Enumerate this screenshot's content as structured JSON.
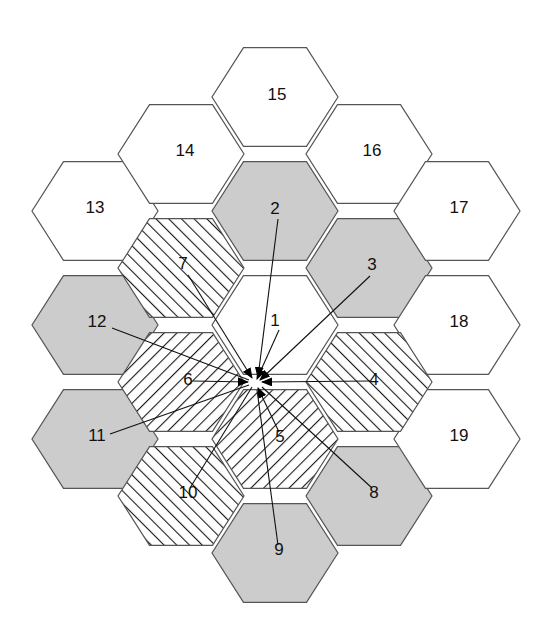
{
  "figure": {
    "type": "hex-grid-diagram",
    "width": 558,
    "height": 640,
    "background": "#ffffff",
    "colors": {
      "white_fill": "#ffffff",
      "gray_fill": "#cccccc",
      "hatch_stroke": "#1a1a1a",
      "outline": "#555555",
      "label_text": "#111111",
      "leader_line": "#111111"
    },
    "hex_geometry": {
      "circumradius": 63,
      "orientation": "flat-top-rotated (vertices left and right)",
      "column_step_x": 94.5,
      "row_step_y": 114,
      "half_row_step_y": 57
    },
    "fill_legend": {
      "white": "plain white fill",
      "gray": "solid light gray fill",
      "hatch-forward": "diagonal hatch lines running lower-left to upper-right ( / )",
      "hatch-back": "diagonal hatch lines running upper-left to lower-right ( \\ )"
    }
  },
  "convergence_point": {
    "x": 255,
    "y": 382
  },
  "cells": [
    {
      "id": "hex-1",
      "label": "1",
      "cx": 275,
      "cy": 325,
      "fill": "white",
      "label_x": 275,
      "label_y": 322,
      "ring": 0
    },
    {
      "id": "hex-2",
      "label": "2",
      "cx": 275,
      "cy": 211,
      "fill": "gray",
      "label_x": 275,
      "label_y": 210,
      "ring": 1
    },
    {
      "id": "hex-3",
      "label": "3",
      "cx": 369,
      "cy": 268,
      "fill": "gray",
      "label_x": 372,
      "label_y": 266,
      "ring": 1
    },
    {
      "id": "hex-4",
      "label": "4",
      "cx": 369,
      "cy": 382,
      "fill": "hatch-forward",
      "label_x": 374,
      "label_y": 381,
      "ring": 1
    },
    {
      "id": "hex-5",
      "label": "5",
      "cx": 275,
      "cy": 439,
      "fill": "hatch-back",
      "label_x": 280,
      "label_y": 438,
      "ring": 1
    },
    {
      "id": "hex-6",
      "label": "6",
      "cx": 181,
      "cy": 382,
      "fill": "hatch-back",
      "label_x": 188,
      "label_y": 381,
      "ring": 1
    },
    {
      "id": "hex-7",
      "label": "7",
      "cx": 181,
      "cy": 268,
      "fill": "hatch-forward",
      "label_x": 183,
      "label_y": 265,
      "ring": 1
    },
    {
      "id": "hex-8",
      "label": "8",
      "cx": 369,
      "cy": 496,
      "fill": "gray",
      "label_x": 374,
      "label_y": 494,
      "ring": 2
    },
    {
      "id": "hex-9",
      "label": "9",
      "cx": 275,
      "cy": 553,
      "fill": "gray",
      "label_x": 279,
      "label_y": 551,
      "ring": 2
    },
    {
      "id": "hex-10",
      "label": "10",
      "cx": 181,
      "cy": 496,
      "fill": "hatch-forward",
      "label_x": 188,
      "label_y": 494,
      "ring": 2
    },
    {
      "id": "hex-11",
      "label": "11",
      "cx": 95,
      "cy": 439,
      "fill": "gray",
      "label_x": 97,
      "label_y": 437,
      "ring": 2
    },
    {
      "id": "hex-12",
      "label": "12",
      "cx": 95,
      "cy": 325,
      "fill": "gray",
      "label_x": 97,
      "label_y": 323,
      "ring": 2
    },
    {
      "id": "hex-13",
      "label": "13",
      "cx": 95,
      "cy": 211,
      "fill": "white",
      "label_x": 95,
      "label_y": 209,
      "ring": 2
    },
    {
      "id": "hex-14",
      "label": "14",
      "cx": 181,
      "cy": 154,
      "fill": "white",
      "label_x": 185,
      "label_y": 152,
      "ring": 2
    },
    {
      "id": "hex-15",
      "label": "15",
      "cx": 275,
      "cy": 97,
      "fill": "white",
      "label_x": 277,
      "label_y": 96,
      "ring": 2
    },
    {
      "id": "hex-16",
      "label": "16",
      "cx": 369,
      "cy": 154,
      "fill": "white",
      "label_x": 372,
      "label_y": 152,
      "ring": 2
    },
    {
      "id": "hex-17",
      "label": "17",
      "cx": 457,
      "cy": 211,
      "fill": "white",
      "label_x": 459,
      "label_y": 209,
      "ring": 2
    },
    {
      "id": "hex-18",
      "label": "18",
      "cx": 457,
      "cy": 325,
      "fill": "white",
      "label_x": 459,
      "label_y": 323,
      "ring": 2
    },
    {
      "id": "hex-19",
      "label": "19",
      "cx": 457,
      "cy": 439,
      "fill": "white",
      "label_x": 459,
      "label_y": 437,
      "ring": 2
    }
  ],
  "leaders": [
    {
      "for": "1",
      "from_x": 279,
      "from_y": 330,
      "to_x": 257,
      "to_y": 379,
      "arrow": true
    },
    {
      "for": "2",
      "from_x": 278,
      "from_y": 219,
      "to_x": 258,
      "to_y": 377,
      "arrow": true
    },
    {
      "for": "3",
      "from_x": 370,
      "from_y": 276,
      "to_x": 260,
      "to_y": 380,
      "arrow": true
    },
    {
      "for": "4",
      "from_x": 370,
      "from_y": 381,
      "to_x": 262,
      "to_y": 382,
      "arrow": true
    },
    {
      "for": "5",
      "from_x": 279,
      "from_y": 432,
      "to_x": 258,
      "to_y": 388,
      "arrow": true
    },
    {
      "for": "6",
      "from_x": 193,
      "from_y": 381,
      "to_x": 248,
      "to_y": 382,
      "arrow": true
    },
    {
      "for": "7",
      "from_x": 188,
      "from_y": 275,
      "to_x": 252,
      "to_y": 378,
      "arrow": true
    },
    {
      "for": "8",
      "from_x": 372,
      "from_y": 488,
      "to_x": 262,
      "to_y": 387,
      "arrow": false
    },
    {
      "for": "9",
      "from_x": 278,
      "from_y": 545,
      "to_x": 257,
      "to_y": 390,
      "arrow": false
    },
    {
      "for": "10",
      "from_x": 190,
      "from_y": 488,
      "to_x": 252,
      "to_y": 387,
      "arrow": false
    },
    {
      "for": "11",
      "from_x": 110,
      "from_y": 434,
      "to_x": 249,
      "to_y": 385,
      "arrow": false
    },
    {
      "for": "12",
      "from_x": 112,
      "from_y": 328,
      "to_x": 249,
      "to_y": 380,
      "arrow": false
    }
  ]
}
